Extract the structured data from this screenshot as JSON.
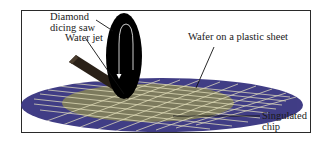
{
  "figure": {
    "labels": {
      "saw": [
        "Diamond",
        "dicing saw"
      ],
      "water_jet": "Water jet",
      "wafer": "Wafer on a plastic sheet",
      "chip": [
        "Singulated",
        "chip"
      ]
    },
    "colors": {
      "plastic_sheet": "#413d86",
      "wafer": "#7d7a5e",
      "dicing_lines": "#e8e4c0",
      "blade": "#000000",
      "nozzle": "#2a2118",
      "frame": "#2a2a2a"
    },
    "icons": {
      "blade_rotation": "rotation-arrow-icon"
    }
  }
}
